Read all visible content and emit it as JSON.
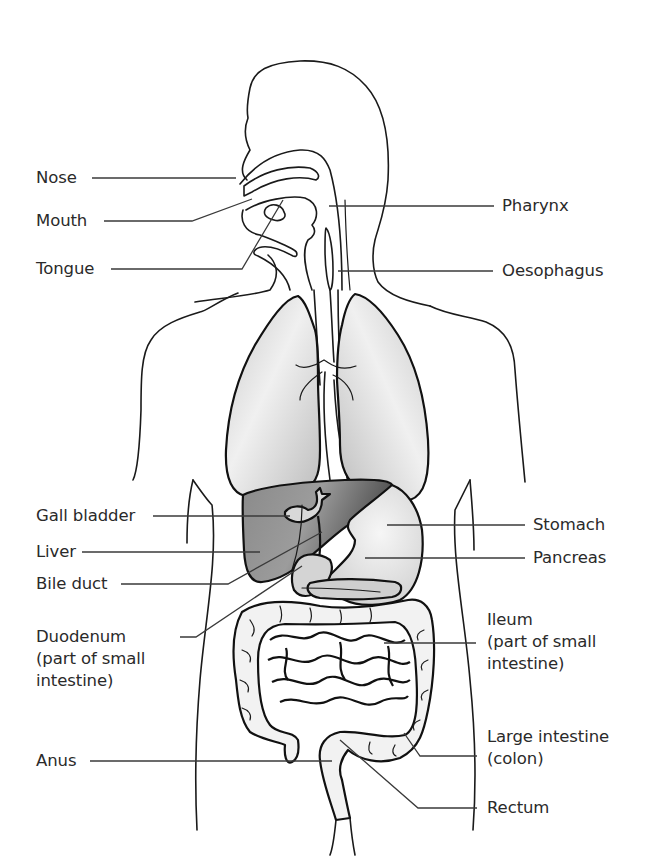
{
  "diagram": {
    "colors": {
      "background": "#ffffff",
      "outline": "#1a1a1a",
      "label_text": "#2a2a2a",
      "lung_fill": "#dcdcdc",
      "liver_fill": "#707070",
      "stomach_fill": "#e4e4e4",
      "intestine_fill": "#f2f2f2"
    },
    "labels_left": [
      {
        "id": "nose",
        "text": "Nose"
      },
      {
        "id": "mouth",
        "text": "Mouth"
      },
      {
        "id": "tongue",
        "text": "Tongue"
      },
      {
        "id": "gall-bladder",
        "text": "Gall bladder"
      },
      {
        "id": "liver",
        "text": "Liver"
      },
      {
        "id": "bile-duct",
        "text": "Bile duct"
      },
      {
        "id": "duodenum",
        "text": "Duodenum",
        "sub1": "(part of small",
        "sub2": "intestine)"
      },
      {
        "id": "anus",
        "text": "Anus"
      }
    ],
    "labels_right": [
      {
        "id": "pharynx",
        "text": "Pharynx"
      },
      {
        "id": "oesophagus",
        "text": "Oesophagus"
      },
      {
        "id": "stomach",
        "text": "Stomach"
      },
      {
        "id": "pancreas",
        "text": "Pancreas"
      },
      {
        "id": "ileum",
        "text": "Ileum",
        "sub1": "(part of small",
        "sub2": "intestine)"
      },
      {
        "id": "large-intestine",
        "text": "Large intestine",
        "sub1": "(colon)"
      },
      {
        "id": "rectum",
        "text": "Rectum"
      }
    ]
  }
}
